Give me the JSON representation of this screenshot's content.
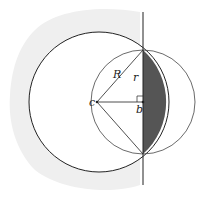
{
  "diagram": {
    "title": "",
    "labels": {
      "big_radius": "R",
      "small_radius": "r",
      "center_big": "c",
      "center_small": "b"
    },
    "colors": {
      "stroke": "#222222",
      "shaded_region": "#555555",
      "background_shadow": "#eeeeee"
    },
    "elements": [
      {
        "type": "circle",
        "name": "large-circle",
        "center_label": "c",
        "radius_label": "R"
      },
      {
        "type": "circle",
        "name": "small-circle",
        "center_label": "b",
        "radius_label": "r"
      },
      {
        "type": "line",
        "name": "vertical-chord-line"
      },
      {
        "type": "region",
        "name": "shaded-lens",
        "description": "region between vertical chord and arc of large circle"
      },
      {
        "type": "right-angle-marker",
        "at": "b"
      }
    ]
  }
}
